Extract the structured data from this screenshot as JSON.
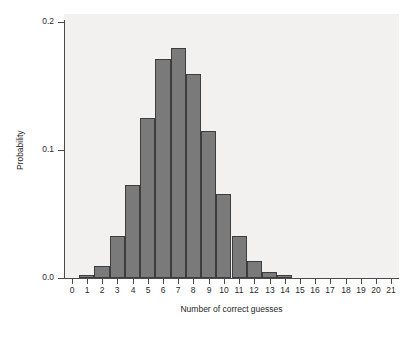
{
  "chart_data": {
    "type": "bar",
    "title": "",
    "subtitle": "",
    "xlabel": "Number of correct guesses",
    "ylabel": "Probability",
    "categories": [
      "0",
      "1",
      "2",
      "3",
      "4",
      "5",
      "6",
      "7",
      "8",
      "9",
      "10",
      "11",
      "12",
      "13",
      "14",
      "15",
      "16",
      "17",
      "18",
      "19",
      "20",
      "21"
    ],
    "values": [
      0.0,
      0.002,
      0.009,
      0.033,
      0.073,
      0.125,
      0.171,
      0.18,
      0.159,
      0.115,
      0.066,
      0.033,
      0.013,
      0.005,
      0.002,
      0.0,
      0.0,
      0.0,
      0.0,
      0.0,
      0.0,
      0.0
    ],
    "xlim": [
      -0.5,
      21.5
    ],
    "ylim": [
      0.0,
      0.2
    ],
    "ytick_values": [
      0.0,
      0.1,
      0.2
    ],
    "ytick_labels": [
      "0.0",
      "0.1",
      "0.2"
    ],
    "xtick_labels": [
      "0",
      "1",
      "2",
      "3",
      "4",
      "5",
      "6",
      "7",
      "8",
      "9",
      "10",
      "11",
      "12",
      "13",
      "14",
      "15",
      "16",
      "17",
      "18",
      "19",
      "20",
      "21"
    ],
    "grid": false,
    "legend": null,
    "legend_position": "none",
    "bar_color": "#7a7a7a",
    "bar_edge_color": "#3d3d3d",
    "plot_background": "#f2f1ef",
    "figure_background": "#ffffff",
    "axis_color": "#4a4a4a",
    "text_color": "#1f1f1f"
  }
}
